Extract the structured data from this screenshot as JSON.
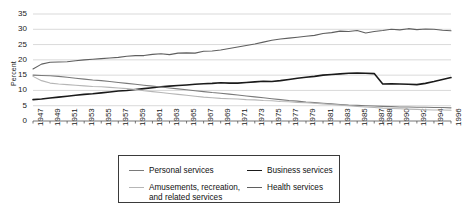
{
  "chart_data": {
    "type": "line",
    "title": "",
    "xlabel": "",
    "ylabel": "Percent",
    "ylim": [
      0,
      35
    ],
    "yticks": [
      0,
      5,
      10,
      15,
      20,
      25,
      30,
      35
    ],
    "grid": true,
    "legend_position": "bottom",
    "xtick_labels": [
      "1947",
      "1949",
      "1951",
      "1953",
      "1955",
      "1957",
      "1959",
      "1961",
      "1963",
      "1965",
      "1967",
      "1969",
      "1971",
      "1973",
      "1975",
      "1977",
      "1979",
      "1981",
      "1983",
      "1985",
      "1987",
      "1988",
      "1990",
      "1992",
      "1994",
      "1996"
    ],
    "x": [
      1947,
      1948,
      1949,
      1950,
      1951,
      1952,
      1953,
      1954,
      1955,
      1956,
      1957,
      1958,
      1959,
      1960,
      1961,
      1962,
      1963,
      1964,
      1965,
      1966,
      1967,
      1968,
      1969,
      1970,
      1971,
      1972,
      1973,
      1974,
      1975,
      1976,
      1977,
      1978,
      1979,
      1980,
      1981,
      1982,
      1983,
      1984,
      1985,
      1986,
      1987,
      1988,
      1989,
      1990,
      1991,
      1992,
      1993,
      1994,
      1995,
      1996
    ],
    "series": [
      {
        "name": "Health services",
        "color": "#5f5f5f",
        "values": [
          17.0,
          18.6,
          19.2,
          19.3,
          19.4,
          19.7,
          20.0,
          20.2,
          20.4,
          20.6,
          20.8,
          21.2,
          21.4,
          21.4,
          21.8,
          22.0,
          21.7,
          22.2,
          22.3,
          22.2,
          22.8,
          22.9,
          23.2,
          23.7,
          24.2,
          24.7,
          25.2,
          25.8,
          26.4,
          26.8,
          27.1,
          27.4,
          27.7,
          28.0,
          28.6,
          28.9,
          29.4,
          29.3,
          29.6,
          28.8,
          29.3,
          29.6,
          30.0,
          29.8,
          30.2,
          29.9,
          30.1,
          30.0,
          29.7,
          29.5
        ]
      },
      {
        "name": "Business services",
        "color": "#1a1a1a",
        "values": [
          7.0,
          7.2,
          7.5,
          7.8,
          8.1,
          8.4,
          8.7,
          8.9,
          9.2,
          9.5,
          9.8,
          10.0,
          10.3,
          10.6,
          10.9,
          11.2,
          11.4,
          11.6,
          11.8,
          12.0,
          12.2,
          12.3,
          12.5,
          12.4,
          12.4,
          12.6,
          12.8,
          13.0,
          12.9,
          13.2,
          13.6,
          14.0,
          14.3,
          14.6,
          15.0,
          15.2,
          15.4,
          15.6,
          15.7,
          15.6,
          15.5,
          12.1,
          12.2,
          12.1,
          12.0,
          11.9,
          12.3,
          12.9,
          13.6,
          14.2
        ]
      },
      {
        "name": "Personal services",
        "color": "#7a7a7a",
        "values": [
          15.0,
          14.9,
          14.8,
          14.6,
          14.3,
          14.0,
          13.7,
          13.4,
          13.2,
          12.9,
          12.6,
          12.3,
          12.0,
          11.7,
          11.4,
          11.1,
          10.8,
          10.5,
          10.2,
          9.9,
          9.6,
          9.3,
          9.1,
          8.8,
          8.5,
          8.2,
          7.9,
          7.6,
          7.3,
          7.0,
          6.7,
          6.5,
          6.2,
          6.0,
          5.8,
          5.6,
          5.4,
          5.2,
          5.1,
          5.0,
          4.9,
          4.8,
          4.7,
          4.6,
          4.6,
          4.5,
          4.5,
          4.4,
          4.4,
          4.3
        ]
      },
      {
        "name": "Amusements, recreation, and related services",
        "color": "#b6b6b6",
        "values": [
          14.6,
          13.2,
          12.4,
          12.1,
          11.9,
          11.7,
          11.5,
          11.3,
          11.2,
          11.0,
          10.8,
          10.6,
          10.3,
          9.9,
          9.6,
          9.3,
          9.0,
          8.7,
          8.4,
          8.1,
          7.8,
          7.6,
          7.4,
          7.3,
          7.2,
          7.0,
          6.9,
          6.7,
          6.6,
          6.4,
          6.3,
          6.1,
          6.0,
          5.8,
          5.6,
          5.4,
          5.2,
          5.0,
          4.8,
          4.6,
          4.4,
          4.2,
          4.1,
          4.0,
          3.9,
          3.8,
          3.7,
          3.6,
          3.6,
          3.5
        ]
      }
    ]
  },
  "legend": {
    "items": [
      {
        "label": "Personal services",
        "color": "#7a7a7a"
      },
      {
        "label": "Business services",
        "color": "#1a1a1a"
      },
      {
        "label": "Amusements, recreation,",
        "label2": "and related services",
        "color": "#b6b6b6"
      },
      {
        "label": "Health services",
        "color": "#5f5f5f"
      }
    ]
  }
}
